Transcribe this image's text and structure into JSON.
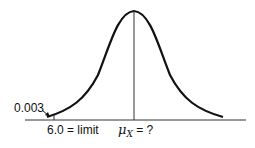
{
  "diagram": {
    "type": "normal-distribution-curve",
    "labels": {
      "tail_probability": "0.003",
      "limit_label": "6.0 = limit",
      "mean_symbol": "μ",
      "mean_subscript": "X",
      "mean_suffix": " = ?"
    },
    "colors": {
      "curve": "#111111",
      "axis": "#333333",
      "background": "#ffffff"
    }
  }
}
